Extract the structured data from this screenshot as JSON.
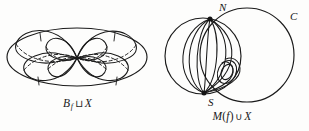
{
  "figure": {
    "background_color": "#fdfdfc",
    "stroke_color": "#1a1a1a",
    "panels": [
      {
        "id": "left",
        "name": "bouquet-of-spheres",
        "caption": {
          "base": "B",
          "subscript": "f",
          "operator": "⊔",
          "operand": "X",
          "full_text": "B_f ⊔ X"
        }
      },
      {
        "id": "right",
        "name": "mapping-cylinder-with-circle",
        "caption": {
          "base": "M",
          "paren_open": "(",
          "argument": "f",
          "paren_close": ")",
          "operator": "∪",
          "operand": "X",
          "full_text": "M(f) ∪ X"
        },
        "point_labels": [
          {
            "name": "north-pole",
            "text": "N"
          },
          {
            "name": "south-pole",
            "text": "S"
          },
          {
            "name": "circle",
            "text": "C"
          }
        ]
      }
    ]
  }
}
